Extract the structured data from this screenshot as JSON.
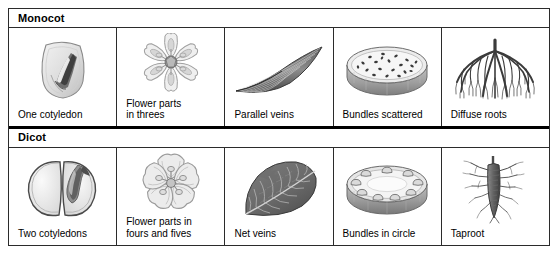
{
  "figure": {
    "name": "monocot-dicot-comparison-chart",
    "border_color": "#2b2b2b",
    "divider_color": "#000000",
    "background": "#ffffff"
  },
  "groups": [
    {
      "id": "monocot",
      "header": "Monocot",
      "cells": [
        {
          "id": "monocot-seed",
          "caption": "One cotyledon",
          "icon": "corn-kernel-seed-icon"
        },
        {
          "id": "monocot-flower",
          "caption": "Flower parts\nin threes",
          "icon": "six-petal-flower-icon"
        },
        {
          "id": "monocot-leaf",
          "caption": "Parallel veins",
          "icon": "parallel-veined-leaf-icon"
        },
        {
          "id": "monocot-stem",
          "caption": "Bundles scattered",
          "icon": "stem-cross-section-scattered-icon"
        },
        {
          "id": "monocot-root",
          "caption": "Diffuse roots",
          "icon": "fibrous-root-icon"
        }
      ]
    },
    {
      "id": "dicot",
      "header": "Dicot",
      "cells": [
        {
          "id": "dicot-seed",
          "caption": "Two cotyledons",
          "icon": "bean-seed-split-icon"
        },
        {
          "id": "dicot-flower",
          "caption": "Flower parts in\nfours and fives",
          "icon": "five-petal-flower-icon"
        },
        {
          "id": "dicot-leaf",
          "caption": "Net veins",
          "icon": "net-veined-leaf-icon"
        },
        {
          "id": "dicot-stem",
          "caption": "Bundles in circle",
          "icon": "stem-cross-section-ring-icon"
        },
        {
          "id": "dicot-root",
          "caption": "Taproot",
          "icon": "taproot-icon"
        }
      ]
    }
  ]
}
